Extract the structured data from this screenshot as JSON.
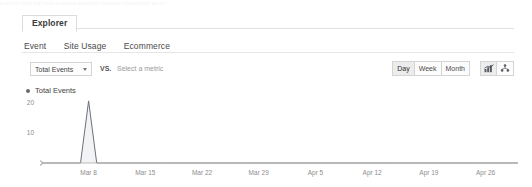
{
  "panel": {
    "main_tab": "Explorer",
    "sub_tabs": [
      {
        "label": "Event"
      },
      {
        "label": "Site Usage"
      },
      {
        "label": "Ecommerce"
      }
    ]
  },
  "controls": {
    "metric_selected": "Total Events",
    "vs_label": "VS.",
    "metric_placeholder": "Select a metric",
    "granularity": [
      {
        "label": "Day",
        "selected": true
      },
      {
        "label": "Week",
        "selected": false
      },
      {
        "label": "Month",
        "selected": false
      }
    ],
    "view_buttons": [
      {
        "name": "chart-view-icon",
        "selected": true
      },
      {
        "name": "scatter-view-icon",
        "selected": false
      }
    ]
  },
  "legend": {
    "series_label": "Total Events",
    "marker_color": "#666a70"
  },
  "colors": {
    "line": "#6b7178",
    "fill": "#f2f3f4",
    "axis": "#b9b9b9",
    "tick_text": "#8d8d8d",
    "border": "#d4d4d4"
  },
  "chart_data": {
    "type": "area",
    "title": "",
    "xlabel": "",
    "ylabel": "",
    "grid": false,
    "legend_position": "top-left",
    "ylim": [
      0,
      22
    ],
    "yticks": [
      10,
      20
    ],
    "ytick_labels": [
      "10",
      "20"
    ],
    "xtick_labels": [
      "Mar 8",
      "Mar 15",
      "Mar 22",
      "Mar 29",
      "Apr 5",
      "Apr 12",
      "Apr 19",
      "Apr 26"
    ],
    "series": [
      {
        "name": "Total Events",
        "x": [
          "Mar 2",
          "Mar 3",
          "Mar 4",
          "Mar 5",
          "Mar 6",
          "Mar 7",
          "Mar 8",
          "Mar 9",
          "Mar 10",
          "Mar 11",
          "Mar 12",
          "Mar 13",
          "Mar 14",
          "Mar 15",
          "Mar 16",
          "Mar 17",
          "Mar 18",
          "Mar 19",
          "Mar 20",
          "Mar 21",
          "Mar 22",
          "Mar 23",
          "Mar 24",
          "Mar 25",
          "Mar 26",
          "Mar 27",
          "Mar 28",
          "Mar 29",
          "Mar 30",
          "Mar 31",
          "Apr 1",
          "Apr 2",
          "Apr 3",
          "Apr 4",
          "Apr 5",
          "Apr 6",
          "Apr 7",
          "Apr 8",
          "Apr 9",
          "Apr 10",
          "Apr 11",
          "Apr 12",
          "Apr 13",
          "Apr 14",
          "Apr 15",
          "Apr 16",
          "Apr 17",
          "Apr 18",
          "Apr 19",
          "Apr 20",
          "Apr 21",
          "Apr 22",
          "Apr 23",
          "Apr 24",
          "Apr 25",
          "Apr 26",
          "Apr 27",
          "Apr 28",
          "Apr 29",
          "Apr 30"
        ],
        "values": [
          0,
          0,
          0,
          0,
          0,
          0,
          21,
          0,
          0,
          0,
          0,
          0,
          0,
          0,
          0,
          0,
          0,
          0,
          0,
          0,
          0,
          0,
          0,
          0,
          0,
          0,
          0,
          0,
          0,
          0,
          0,
          0,
          0,
          0,
          0,
          0,
          0,
          0,
          0,
          0,
          0,
          0,
          0,
          0,
          0,
          0,
          0,
          0,
          0,
          0,
          0,
          0,
          0,
          0,
          0,
          0,
          0,
          0,
          0,
          0
        ],
        "peak_label": "Mar 8",
        "peak_value": 21
      }
    ]
  },
  "ghost_strip": "analytics reporting  home  audience  acquisition  behavior  conversions  admin"
}
